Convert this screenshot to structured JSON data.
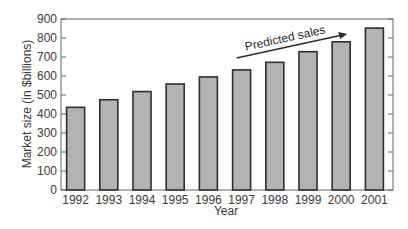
{
  "chart_data": {
    "type": "bar",
    "title": "",
    "xlabel": "Year",
    "ylabel": "Market size (in $billions)",
    "categories": [
      "1992",
      "1993",
      "1994",
      "1995",
      "1996",
      "1997",
      "1998",
      "1999",
      "2000",
      "2001"
    ],
    "values": [
      435,
      475,
      518,
      558,
      595,
      632,
      672,
      728,
      780,
      852
    ],
    "ylim": [
      0,
      900
    ],
    "yticks": [
      0,
      100,
      200,
      300,
      400,
      500,
      600,
      700,
      800,
      900
    ],
    "grid": false,
    "legend": null,
    "annotations": [
      {
        "text": "Predicted sales",
        "type": "arrow",
        "from_category": "1997",
        "to_category": "2000"
      }
    ],
    "colors": {
      "bar_fill": "#b3b3b3",
      "bar_edge": "#2e2e2e",
      "axis": "#666666"
    }
  }
}
